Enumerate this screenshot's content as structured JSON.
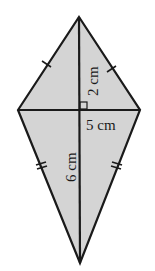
{
  "diagram": {
    "shape": "kite",
    "fill_color": "#d4d4d4",
    "stroke_color": "#1a1a1a",
    "vertices": {
      "top": [
        79,
        17
      ],
      "left": [
        18,
        110
      ],
      "right": [
        140,
        110
      ],
      "bottom": [
        80,
        263
      ]
    },
    "labels": {
      "upper_vertical": "2 cm",
      "horizontal": "5 cm",
      "lower_vertical": "6 cm"
    },
    "markings": {
      "upper_edges": "single tick (equal)",
      "lower_edges": "double tick (equal)",
      "center": "right angle"
    }
  }
}
